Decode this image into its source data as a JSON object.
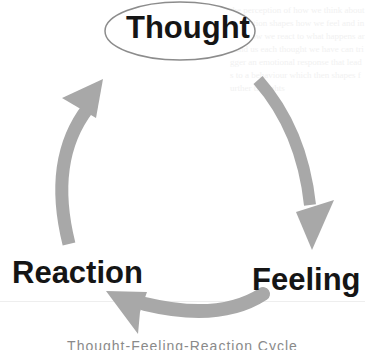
{
  "diagram": {
    "type": "cycle",
    "nodes": [
      {
        "id": "thought",
        "label": "Thought",
        "shape": "ellipse"
      },
      {
        "id": "feeling",
        "label": "Feeling",
        "shape": "text"
      },
      {
        "id": "reaction",
        "label": "Reaction",
        "shape": "text"
      }
    ],
    "edges": [
      {
        "from": "thought",
        "to": "feeling",
        "direction": "clockwise"
      },
      {
        "from": "feeling",
        "to": "reaction",
        "direction": "clockwise"
      },
      {
        "from": "reaction",
        "to": "thought",
        "direction": "clockwise"
      }
    ],
    "caption": "Thought-Feeling-Reaction Cycle",
    "colors": {
      "arrow": "#a8a8a8",
      "ellipse_stroke": "#8c8c8c",
      "label": "#151515",
      "caption": "#8a8a8a",
      "background": "#ffffff"
    }
  },
  "background_text": "the perception of how we think about a situation shapes how we feel and in turn how we react to what happens around us each thought we have can trigger an emotional response that leads to a behaviour which then shapes further thoughts"
}
